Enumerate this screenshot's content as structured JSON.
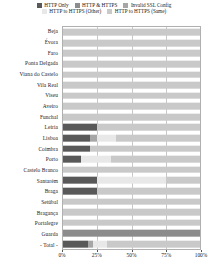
{
  "chart_data": {
    "type": "bar",
    "orientation": "horizontal",
    "stacked": true,
    "normalized": "100%",
    "title": "",
    "xlabel": "",
    "ylabel": "",
    "xlim": [
      0,
      100
    ],
    "xticks": [
      0,
      25,
      50,
      75,
      100
    ],
    "xticklabels": [
      "0%",
      "25%",
      "50%",
      "75%",
      "100%"
    ],
    "grid": true,
    "grid_axis": "x",
    "legend_position": "top",
    "legend": [
      {
        "name": "HTTP Only",
        "color": "#595959"
      },
      {
        "name": "HTTP & HTTPS",
        "color": "#8c8c8c"
      },
      {
        "name": "Invalid SSL Config",
        "color": "#a6a6a6"
      },
      {
        "name": "HTTP to HTTPS (Other)",
        "color": "#e8e8e8"
      },
      {
        "name": "HTTP to HTTPS (Same)",
        "color": "#c9c9c9"
      }
    ],
    "categories": [
      "Beja",
      "Évora",
      "Faro",
      "Ponta Delgada",
      "Viana do Castelo",
      "Vila Real",
      "Viseu",
      "Aveiro",
      "Funchal",
      "Leiria",
      "Lisboa",
      "Coimbra",
      "Porto",
      "Castelo Branco",
      "Santarém",
      "Braga",
      "Setúbal",
      "Bragança",
      "Portalegre",
      "Guarda",
      "- Total -"
    ],
    "series": [
      {
        "name": "HTTP Only",
        "color": "#595959",
        "values": [
          0,
          0,
          0,
          0,
          0,
          0,
          0,
          0,
          0,
          25,
          20,
          20,
          13,
          0,
          25,
          25,
          0,
          0,
          0,
          0,
          18
        ]
      },
      {
        "name": "HTTP & HTTPS",
        "color": "#8c8c8c",
        "values": [
          0,
          0,
          0,
          0,
          0,
          0,
          0,
          0,
          0,
          0,
          0,
          0,
          0,
          0,
          0,
          0,
          0,
          0,
          0,
          100,
          0
        ]
      },
      {
        "name": "Invalid SSL Config",
        "color": "#a6a6a6",
        "values": [
          0,
          0,
          0,
          0,
          0,
          0,
          0,
          0,
          0,
          0,
          5,
          0,
          0,
          0,
          0,
          0,
          0,
          0,
          0,
          0,
          4
        ]
      },
      {
        "name": "HTTP to HTTPS (Other)",
        "color": "#e8e8e8",
        "values": [
          0,
          0,
          0,
          0,
          0,
          0,
          0,
          0,
          0,
          0,
          14,
          0,
          22,
          0,
          50,
          0,
          0,
          0,
          0,
          0,
          10
        ]
      },
      {
        "name": "HTTP to HTTPS (Same)",
        "color": "#c9c9c9",
        "values": [
          100,
          100,
          100,
          100,
          100,
          100,
          100,
          100,
          100,
          75,
          61,
          80,
          65,
          100,
          25,
          75,
          100,
          100,
          100,
          0,
          68
        ]
      }
    ]
  }
}
